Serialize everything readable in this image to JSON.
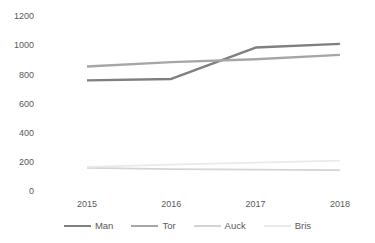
{
  "chart_data": {
    "type": "line",
    "x": [
      "2015",
      "2016",
      "2017",
      "2018"
    ],
    "series": [
      {
        "name": "Man",
        "values": [
          760,
          770,
          985,
          1010
        ],
        "color": "#7f7f7f",
        "width": 2.4
      },
      {
        "name": "Tor",
        "values": [
          855,
          885,
          905,
          935
        ],
        "color": "#a6a6a6",
        "width": 2.4
      },
      {
        "name": "Auck",
        "values": [
          160,
          152,
          148,
          145
        ],
        "color": "#d4d4d4",
        "width": 1.8
      },
      {
        "name": "Bris",
        "values": [
          168,
          183,
          196,
          210
        ],
        "color": "#eaeaea",
        "width": 1.8
      }
    ],
    "title": "",
    "xlabel": "",
    "ylabel": "",
    "ylim": [
      0,
      1200
    ],
    "yticks": [
      0,
      200,
      400,
      600,
      800,
      1000,
      1200
    ],
    "ytick_labels": [
      "0",
      "200",
      "400",
      "600",
      "800",
      "1000",
      "1200"
    ],
    "grid": false,
    "legend_position": "bottom",
    "legend_entries": [
      "Man",
      "Tor",
      "Auck",
      "Bris"
    ]
  },
  "colors": {
    "background": "#ffffff",
    "axis_text": "#595959",
    "legend_text": "#595959"
  }
}
